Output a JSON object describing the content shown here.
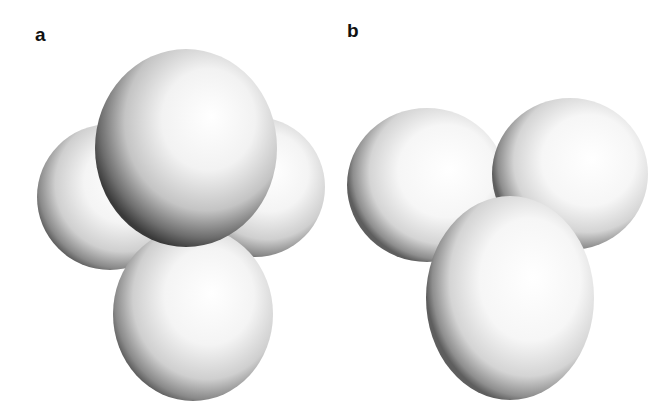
{
  "panels": [
    {
      "label": "a",
      "description": "Four-sphere cluster: one large sphere in front, two spheres behind left and right, one elongated sphere below",
      "spheres": [
        {
          "name": "left-back-sphere",
          "cx": 110,
          "cy": 197,
          "rx": 73,
          "ry": 73
        },
        {
          "name": "right-back-sphere",
          "cx": 255,
          "cy": 187,
          "rx": 70,
          "ry": 70
        },
        {
          "name": "bottom-sphere",
          "cx": 193,
          "cy": 314,
          "rx": 80,
          "ry": 87
        },
        {
          "name": "top-front-sphere",
          "cx": 186,
          "cy": 148,
          "rx": 91,
          "ry": 99
        }
      ]
    },
    {
      "label": "b",
      "description": "Three-sphere cluster: two spheres on top side by side, one elongated sphere in front below",
      "spheres": [
        {
          "name": "left-sphere",
          "cx": 427,
          "cy": 185,
          "rx": 80,
          "ry": 77
        },
        {
          "name": "right-sphere",
          "cx": 570,
          "cy": 174,
          "rx": 78,
          "ry": 76
        },
        {
          "name": "bottom-front-sphere",
          "cx": 510,
          "cy": 298,
          "rx": 84,
          "ry": 102
        }
      ]
    }
  ],
  "colors": {
    "background": "#ffffff",
    "sphere_highlight": "#ffffff",
    "sphere_mid": "#e6e6e6",
    "sphere_edge": "#5a5a5a",
    "label": "#111111"
  }
}
